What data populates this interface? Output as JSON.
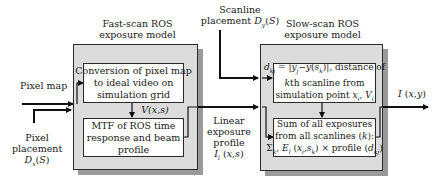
{
  "diagram": {
    "fast_scan": {
      "title_lines": [
        "Fast-scan ROS",
        "exposure model"
      ],
      "box1_lines": [
        "Conversion of pixel map",
        "to ideal video on",
        "simulation grid"
      ],
      "intermediate_label": "V(x,s)",
      "box2_lines": [
        "MTF of ROS time",
        "response and beam",
        "profile"
      ]
    },
    "slow_scan": {
      "title_lines": [
        "Slow-scan ROS",
        "exposure model"
      ],
      "box1_lines": [
        "d_kj = |y_j − y(s_k)|, distance of",
        "kth scanline from",
        "simulation point x_i, V_i"
      ],
      "box2_lines": [
        "Sum of all exposures",
        "from all scanlines (k):",
        "Σ_k, E_l (x_i,s_k) × profile (d_kj)"
      ]
    },
    "inputs": {
      "pixel_map": "Pixel map",
      "pixel_placement_lines": [
        "Pixel",
        "placement",
        "D_x(S)"
      ],
      "scanline_placement_lines": [
        "Scanline",
        "placement D_y(S)"
      ]
    },
    "linear_exposure_lines": [
      "Linear",
      "exposure",
      "profile",
      "I_l (x,s)"
    ],
    "output_label": "I (x,y)",
    "colors": {
      "outer_fill": "#dcdcdc",
      "shadow": "#9a9a9a",
      "line": "#111111",
      "inner_fill": "#ffffff"
    }
  }
}
